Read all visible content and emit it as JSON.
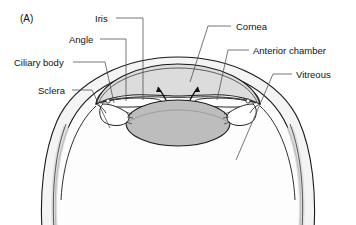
{
  "figure": {
    "panel_id": "(A)",
    "background_color": "#ffffff",
    "ink_color": "#111111"
  },
  "labels": [
    {
      "key": "iris",
      "text": "Iris",
      "text_x": 95,
      "text_y": 14,
      "align": "left",
      "leader": "M116,18 L143,18 L143,100",
      "target": "iris root / pupillary margin"
    },
    {
      "key": "angle",
      "text": "Angle",
      "text_x": 69,
      "text_y": 35,
      "align": "left",
      "leader": "M100,39 L126,39 L126,101",
      "target": "iridocorneal angle"
    },
    {
      "key": "ciliary_body",
      "text": "Ciliary body",
      "text_x": 14,
      "text_y": 58,
      "align": "left",
      "leader": "M73,62 L105,62 L114,103",
      "target": "ciliary body"
    },
    {
      "key": "sclera",
      "text": "Sclera",
      "text_x": 38,
      "text_y": 86,
      "align": "left",
      "leader": "M72,90 L92,90 L110,128",
      "target": "sclera wall"
    },
    {
      "key": "cornea",
      "text": "Cornea",
      "text_x": 236,
      "text_y": 22,
      "align": "left",
      "leader": "M231,26 L208,26 L190,82",
      "target": "cornea"
    },
    {
      "key": "anterior_chamber",
      "text": "Anterior chamber",
      "text_x": 253,
      "text_y": 46,
      "align": "left",
      "leader": "M249,50 L228,50 L217,100",
      "target": "anterior chamber"
    },
    {
      "key": "vitreous",
      "text": "Vitreous",
      "text_x": 296,
      "text_y": 70,
      "align": "left",
      "leader": "M292,74 L273,74 L236,160",
      "target": "vitreous cavity"
    }
  ],
  "structures": {
    "cornea_fill": "#dcdcdc",
    "lens_fill": "#bdbdbd",
    "sclera_fill": "#f2f2f2",
    "sclera_shade": "#d8d8d8",
    "interior_fill": "#fdfdfd",
    "ciliary_fill": "#ffffff",
    "arrow_count": 2,
    "arrow_meaning": "aqueous humour flow through the pupil"
  }
}
